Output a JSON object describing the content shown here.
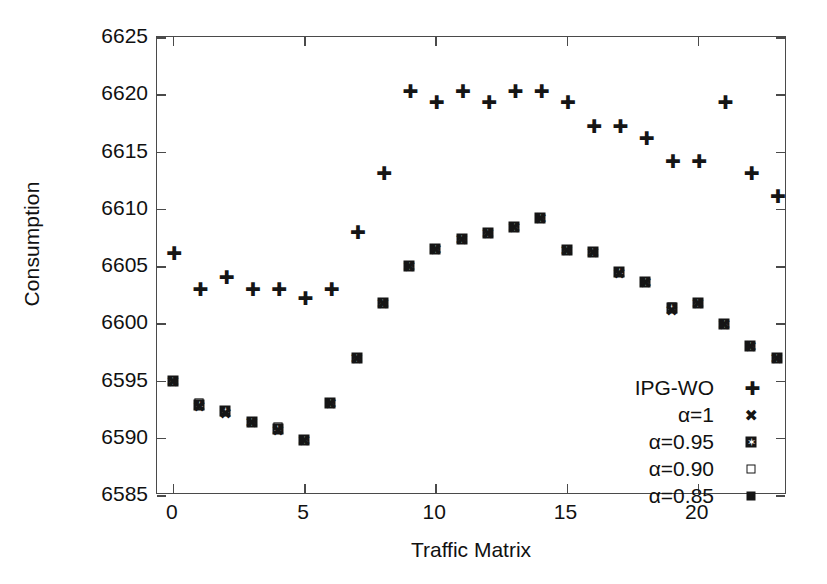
{
  "chart_data": {
    "type": "scatter",
    "title": "",
    "xlabel": "Traffic Matrix",
    "ylabel": "Consumption",
    "xlim": [
      -0.6,
      23.4
    ],
    "ylim": [
      6585,
      6625
    ],
    "xticks": [
      0,
      5,
      10,
      15,
      20
    ],
    "yticks": [
      6585,
      6590,
      6595,
      6600,
      6605,
      6610,
      6615,
      6620,
      6625
    ],
    "grid": false,
    "legend_position": "lower-right",
    "x": [
      0,
      1,
      2,
      3,
      4,
      5,
      6,
      7,
      8,
      9,
      10,
      11,
      12,
      13,
      14,
      15,
      16,
      17,
      18,
      19,
      20,
      21,
      22,
      23
    ],
    "series": [
      {
        "name": "IPG-WO",
        "marker": "plus",
        "values": [
          6606.1,
          6603.0,
          6604.0,
          6603.0,
          6603.0,
          6602.2,
          6603.0,
          6608.0,
          6613.1,
          6620.3,
          6619.3,
          6620.3,
          6619.3,
          6620.3,
          6620.3,
          6619.3,
          6617.2,
          6617.2,
          6616.2,
          6614.2,
          6614.2,
          6619.3,
          6613.1,
          6611.1
        ]
      },
      {
        "name": "α=1",
        "marker": "cross",
        "values": [
          6595.0,
          6592.8,
          6592.2,
          6591.4,
          6590.7,
          6589.8,
          6593.0,
          6597.0,
          6601.8,
          6605.0,
          6606.5,
          6607.4,
          6607.9,
          6608.4,
          6609.2,
          6606.4,
          6606.2,
          6604.4,
          6603.6,
          6601.2,
          6601.8,
          6599.9,
          6598.0,
          6597.0
        ]
      },
      {
        "name": "α=0.95",
        "marker": "star-square",
        "values": [
          6595.0,
          6592.9,
          6592.3,
          6591.4,
          6590.8,
          6589.8,
          6593.0,
          6597.0,
          6601.8,
          6605.0,
          6606.5,
          6607.4,
          6607.9,
          6608.4,
          6609.2,
          6606.4,
          6606.2,
          6604.5,
          6603.6,
          6601.3,
          6601.8,
          6599.9,
          6598.0,
          6597.0
        ]
      },
      {
        "name": "α=0.90",
        "marker": "open-square",
        "values": [
          6595.0,
          6593.0,
          6592.3,
          6591.4,
          6590.9,
          6589.8,
          6593.0,
          6597.0,
          6601.8,
          6605.0,
          6606.5,
          6607.4,
          6607.9,
          6608.4,
          6609.2,
          6606.4,
          6606.2,
          6604.5,
          6603.6,
          6601.4,
          6601.8,
          6599.9,
          6598.0,
          6597.0
        ]
      },
      {
        "name": "α=0.85",
        "marker": "filled-square",
        "values": [
          6595.0,
          6593.0,
          6592.3,
          6591.4,
          6590.9,
          6589.8,
          6593.0,
          6597.0,
          6601.8,
          6605.0,
          6606.5,
          6607.4,
          6607.9,
          6608.4,
          6609.2,
          6606.4,
          6606.2,
          6604.5,
          6603.6,
          6601.4,
          6601.8,
          6599.9,
          6598.0,
          6597.0
        ]
      }
    ],
    "legend": [
      {
        "label": "IPG-WO",
        "marker": "plus"
      },
      {
        "label": "α=1",
        "marker": "cross"
      },
      {
        "label": "α=0.95",
        "marker": "star-square"
      },
      {
        "label": "α=0.90",
        "marker": "open-square"
      },
      {
        "label": "α=0.85",
        "marker": "filled-square"
      }
    ],
    "colors": {
      "marker": "#151515",
      "axis": "#4a4a4a",
      "background": "#ffffff",
      "text": "#111111"
    }
  }
}
